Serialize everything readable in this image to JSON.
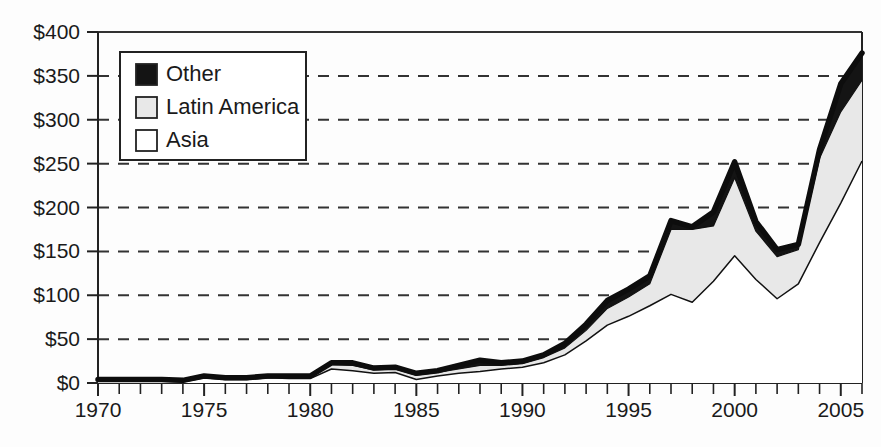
{
  "chart_data": {
    "type": "area",
    "stacked": true,
    "title": "",
    "subtitle": "",
    "xlabel": "",
    "ylabel": "",
    "grid": "horizontal-dashed",
    "legend_position": "upper-left-inside",
    "xlim": [
      1970,
      2006
    ],
    "ylim": [
      0,
      400
    ],
    "y_tick_labels": [
      "$0",
      "$50",
      "$100",
      "$150",
      "$200",
      "$250",
      "$300",
      "$350",
      "$400"
    ],
    "y_tick_values": [
      0,
      50,
      100,
      150,
      200,
      250,
      300,
      350,
      400
    ],
    "x_tick_labels": [
      "1970",
      "1975",
      "1980",
      "1985",
      "1990",
      "1995",
      "2000",
      "2005"
    ],
    "x_tick_values": [
      1970,
      1975,
      1980,
      1985,
      1990,
      1995,
      2000,
      2005
    ],
    "x_minor_tick_step": 1,
    "legend": [
      {
        "label": "Other",
        "swatch": "#141414"
      },
      {
        "label": "Latin America",
        "swatch": "#e8e8e8"
      },
      {
        "label": "Asia",
        "swatch": "#ffffff"
      }
    ],
    "x": [
      1970,
      1971,
      1972,
      1973,
      1974,
      1975,
      1976,
      1977,
      1978,
      1979,
      1980,
      1981,
      1982,
      1983,
      1984,
      1985,
      1986,
      1987,
      1988,
      1989,
      1990,
      1991,
      1992,
      1993,
      1994,
      1995,
      1996,
      1997,
      1998,
      1999,
      2000,
      2001,
      2002,
      2003,
      2004,
      2005,
      2006
    ],
    "series": [
      {
        "name": "Asia",
        "swatch": "#ffffff",
        "values": [
          2,
          2,
          2,
          2,
          1,
          6,
          4,
          4,
          6,
          5,
          5,
          16,
          14,
          11,
          12,
          4,
          8,
          11,
          13,
          16,
          18,
          23,
          32,
          48,
          66,
          76,
          88,
          101,
          92,
          116,
          145,
          118,
          96,
          113,
          160,
          205,
          253
        ]
      },
      {
        "name": "Latin America",
        "swatch": "#e8e8e8",
        "values": [
          1,
          1,
          1,
          1,
          1,
          1,
          1,
          1,
          1,
          2,
          2,
          5,
          6,
          4,
          4,
          5,
          4,
          5,
          7,
          4,
          4,
          6,
          8,
          12,
          19,
          22,
          25,
          74,
          83,
          63,
          89,
          55,
          48,
          39,
          96,
          104,
          92
        ]
      },
      {
        "name": "Other",
        "swatch": "#141414",
        "values": [
          1,
          1,
          1,
          1,
          1,
          1,
          1,
          1,
          1,
          1,
          1,
          2,
          3,
          2,
          2,
          2,
          2,
          4,
          6,
          3,
          3,
          3,
          5,
          7,
          9,
          9,
          9,
          10,
          3,
          16,
          18,
          11,
          8,
          6,
          10,
          32,
          31
        ]
      }
    ]
  }
}
